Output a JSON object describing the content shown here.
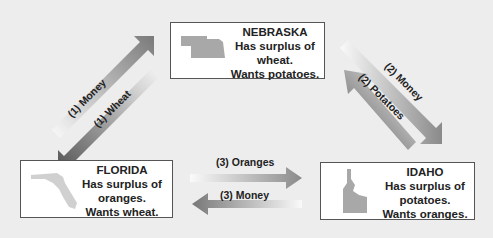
{
  "nebraska": {
    "name": "NEBRASKA",
    "line1": "Has surplus of",
    "line2": "wheat.",
    "line3": "Wants potatoes.",
    "shape": "nebraska-map-icon"
  },
  "florida": {
    "name": "FLORIDA",
    "line1": "Has surplus of",
    "line2": "oranges.",
    "line3": "Wants wheat.",
    "shape": "florida-map-icon"
  },
  "idaho": {
    "name": "IDAHO",
    "line1": "Has surplus of",
    "line2": "potatoes.",
    "line3": "Wants oranges.",
    "shape": "idaho-map-icon"
  },
  "arrows": {
    "fl_to_ne": "(1) Money",
    "ne_to_fl": "(1) Wheat",
    "ne_to_id": "(2) Money",
    "id_to_ne": "(2) Potatoes",
    "fl_to_id": "(3) Oranges",
    "id_to_fl": "(3) Money"
  },
  "colors": {
    "background": "#ededed",
    "arrow_dark": "#555555",
    "map_gray": "#a8a8a8"
  }
}
